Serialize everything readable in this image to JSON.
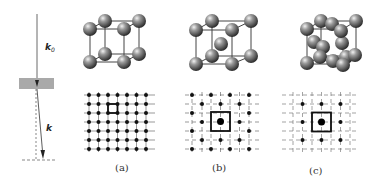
{
  "diagram": {
    "beam_panel": {
      "incident_vector_label": "k",
      "incident_vector_subscript": "0",
      "diffracted_vector_label": "k",
      "specimen": "gray-slab"
    },
    "panels": [
      {
        "id": "a",
        "label": "(a)",
        "structure": "simple-cubic",
        "pattern_grid": "7x7"
      },
      {
        "id": "b",
        "label": "(b)",
        "structure": "body-centered-cubic",
        "pattern_grid": "centered"
      },
      {
        "id": "c",
        "label": "(c)",
        "structure": "face-centered-cubic",
        "pattern_grid": "centered-sparse"
      }
    ],
    "colors": {
      "line": "#333333",
      "slab": "#a9a9a9",
      "atom_dark": "#3a3a3a",
      "atom_light": "#d8d8d8"
    }
  }
}
